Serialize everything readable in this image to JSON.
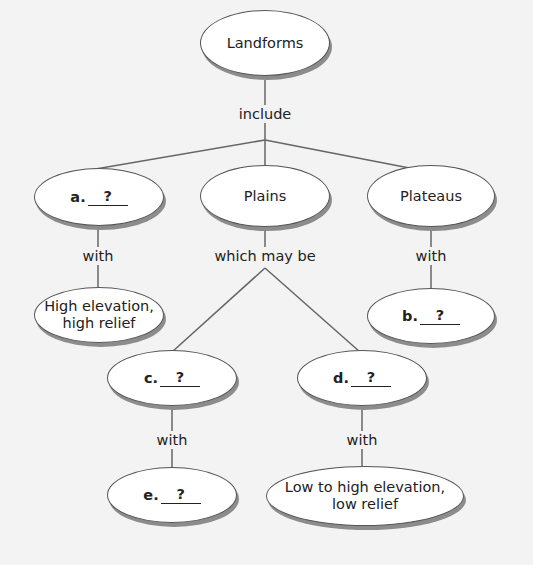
{
  "diagram": {
    "type": "concept-map",
    "root": {
      "label": "Landforms"
    },
    "link_root": "include",
    "level1": [
      {
        "id": "a",
        "letter": "a.",
        "blank": "?"
      },
      {
        "id": "plains",
        "label": "Plains"
      },
      {
        "id": "plateaus",
        "label": "Plateaus"
      }
    ],
    "link_a": "with",
    "node_a_child": {
      "line1": "High elevation,",
      "line2": "high relief"
    },
    "link_plains": "which may be",
    "link_plateaus": "with",
    "node_b": {
      "letter": "b.",
      "blank": "?"
    },
    "node_c": {
      "letter": "c.",
      "blank": "?"
    },
    "node_d": {
      "letter": "d.",
      "blank": "?"
    },
    "link_c": "with",
    "link_d": "with",
    "node_e": {
      "letter": "e.",
      "blank": "?"
    },
    "node_d_child": {
      "line1": "Low to high elevation,",
      "line2": "low relief"
    }
  }
}
